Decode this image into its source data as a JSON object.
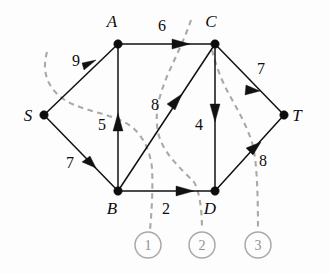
{
  "figure": {
    "background_color": "#fdfdfd",
    "edge_color": "#111111",
    "cut_color": "#a9a9a9"
  },
  "nodes": [
    {
      "id": "S",
      "label": "S",
      "x": 44,
      "y": 115,
      "label_x": 28,
      "label_y": 121
    },
    {
      "id": "A",
      "label": "A",
      "x": 118,
      "y": 44,
      "label_x": 112,
      "label_y": 27
    },
    {
      "id": "B",
      "label": "B",
      "x": 118,
      "y": 191,
      "label_x": 112,
      "label_y": 214
    },
    {
      "id": "C",
      "label": "C",
      "x": 215,
      "y": 44,
      "label_x": 211,
      "label_y": 27
    },
    {
      "id": "D",
      "label": "D",
      "x": 215,
      "y": 191,
      "label_x": 210,
      "label_y": 214
    },
    {
      "id": "T",
      "label": "T",
      "x": 284,
      "y": 115,
      "label_x": 297,
      "label_y": 121
    }
  ],
  "edges": [
    {
      "id": "S-A",
      "from": "S",
      "to": "A",
      "capacity": "9",
      "label_x": 76,
      "label_y": 66
    },
    {
      "id": "S-B",
      "from": "S",
      "to": "B",
      "capacity": "7",
      "label_x": 70,
      "label_y": 168
    },
    {
      "id": "B-A",
      "from": "B",
      "to": "A",
      "capacity": "5",
      "label_x": 102,
      "label_y": 130
    },
    {
      "id": "A-C",
      "from": "A",
      "to": "C",
      "capacity": "6",
      "label_x": 162,
      "label_y": 31
    },
    {
      "id": "B-C",
      "from": "B",
      "to": "C",
      "capacity": "8",
      "label_x": 155,
      "label_y": 110
    },
    {
      "id": "C-D",
      "from": "C",
      "to": "D",
      "capacity": "4",
      "label_x": 199,
      "label_y": 130
    },
    {
      "id": "B-D",
      "from": "B",
      "to": "D",
      "capacity": "2",
      "label_x": 166,
      "label_y": 214
    },
    {
      "id": "C-T",
      "from": "C",
      "to": "T",
      "capacity": "7",
      "label_x": 261,
      "label_y": 74
    },
    {
      "id": "D-T",
      "from": "D",
      "to": "T",
      "capacity": "8",
      "label_x": 263,
      "label_y": 166
    }
  ],
  "cuts": [
    {
      "id": "cut-1",
      "number": "1",
      "circle_x": 148,
      "circle_y": 245,
      "circle_r": 13
    },
    {
      "id": "cut-2",
      "number": "2",
      "circle_x": 202,
      "circle_y": 245,
      "circle_r": 13
    },
    {
      "id": "cut-3",
      "number": "3",
      "circle_x": 258,
      "circle_y": 245,
      "circle_r": 13
    }
  ]
}
